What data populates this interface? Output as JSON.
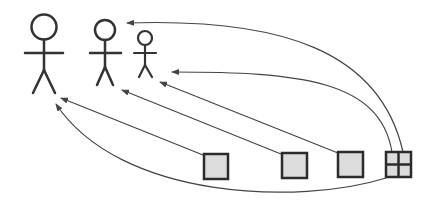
{
  "diagram": {
    "type": "actor-to-component mapping",
    "colors": {
      "stroke": "#333333",
      "arrow": "#444444",
      "box_fill": "#dcdcdc",
      "background": "#ffffff"
    },
    "actors": [
      {
        "id": "actor-large",
        "size": "large"
      },
      {
        "id": "actor-medium",
        "size": "medium"
      },
      {
        "id": "actor-small",
        "size": "small"
      }
    ],
    "components": [
      {
        "id": "box-1",
        "kind": "square"
      },
      {
        "id": "box-2",
        "kind": "square"
      },
      {
        "id": "box-3",
        "kind": "square"
      },
      {
        "id": "box-4",
        "kind": "grid-square-2x2"
      }
    ],
    "edges": [
      {
        "from": "box-1",
        "to": "actor-large"
      },
      {
        "from": "box-2",
        "to": "actor-medium"
      },
      {
        "from": "box-3",
        "to": "actor-small"
      },
      {
        "from": "box-4",
        "to": "actor-medium"
      },
      {
        "from": "box-4",
        "to": "actor-small"
      },
      {
        "from": "box-4",
        "to": "actor-large"
      }
    ]
  }
}
